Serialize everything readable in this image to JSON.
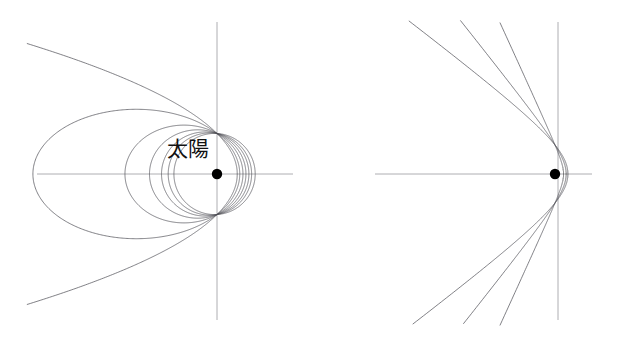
{
  "figure": {
    "title": "",
    "background_color": "#ffffff",
    "curve_color": "#4a4a52",
    "axis_color": "#9a9a9e",
    "sun_color": "#000000",
    "width": 619,
    "height": 342
  },
  "panels": [
    {
      "id": "left",
      "name": "elliptical-and-parabolic-orbits",
      "sun_label": "太陽",
      "sun_point": {
        "x": 217,
        "y": 174
      },
      "axes": {
        "horizontal": {
          "x1": 37,
          "y1": 174,
          "x2": 293,
          "y2": 174
        },
        "vertical": {
          "x1": 217,
          "y1": 22,
          "x2": 217,
          "y2": 320
        }
      },
      "orbit_count": 7
    },
    {
      "id": "right",
      "name": "hyperbolic-orbits",
      "sun_label": "太陽",
      "sun_point": {
        "x": 555,
        "y": 174
      },
      "axes": {
        "horizontal": {
          "x1": 375,
          "y1": 174,
          "x2": 592,
          "y2": 174
        },
        "vertical": {
          "x1": 558,
          "y1": 22,
          "x2": 558,
          "y2": 320
        }
      },
      "orbit_count": 3
    }
  ],
  "chart_data": {
    "type": "line",
    "title": "",
    "subtitle": "",
    "xlabel": "",
    "ylabel": "",
    "grid": false,
    "legend": "none",
    "annotations": [
      {
        "text": "太陽",
        "x": 217,
        "y": 174,
        "panel": "left"
      },
      {
        "text": "太陽",
        "x": 555,
        "y": 174,
        "panel": "right"
      }
    ],
    "series": [
      {
        "name": "ellipse-1",
        "panel": "left",
        "conic": "ellipse",
        "eccentricity": 0.78,
        "focus": [
          217,
          174
        ],
        "left_vertex_x": 37,
        "right_vertex_x": 245,
        "semi_minor": 86
      },
      {
        "name": "ellipse-2",
        "panel": "left",
        "conic": "ellipse",
        "eccentricity": 0.56,
        "focus": [
          217,
          174
        ],
        "left_vertex_x": 127,
        "right_vertex_x": 250,
        "semi_minor": 58
      },
      {
        "name": "ellipse-3",
        "panel": "left",
        "conic": "ellipse",
        "eccentricity": 0.4,
        "focus": [
          217,
          174
        ],
        "left_vertex_x": 155,
        "right_vertex_x": 253,
        "semi_minor": 48
      },
      {
        "name": "ellipse-4",
        "panel": "left",
        "conic": "ellipse",
        "eccentricity": 0.27,
        "focus": [
          217,
          174
        ],
        "left_vertex_x": 172,
        "right_vertex_x": 255,
        "semi_minor": 43
      },
      {
        "name": "ellipse-5",
        "panel": "left",
        "conic": "ellipse",
        "eccentricity": 0.17,
        "focus": [
          217,
          174
        ],
        "left_vertex_x": 180,
        "right_vertex_x": 256,
        "semi_minor": 41
      },
      {
        "name": "ellipse-6",
        "panel": "left",
        "conic": "circle",
        "eccentricity": 0.06,
        "focus": [
          217,
          174
        ],
        "left_vertex_x": 185,
        "right_vertex_x": 258,
        "semi_minor": 40
      },
      {
        "name": "parabola",
        "panel": "left",
        "conic": "parabola",
        "eccentricity": 1.0,
        "focus": [
          217,
          174
        ],
        "vertex_x": 180,
        "open_end_x": 28,
        "open_end_y_top": 44,
        "open_end_y_bottom": 304
      },
      {
        "name": "hyperbola-1",
        "panel": "right",
        "conic": "hyperbola",
        "eccentricity": 1.25,
        "focus": [
          555,
          174
        ],
        "vertex_x": 567,
        "open_end_x": 382,
        "open_end_y_top": 26,
        "open_end_y_bottom": 322
      },
      {
        "name": "hyperbola-2",
        "panel": "right",
        "conic": "hyperbola",
        "eccentricity": 1.6,
        "focus": [
          555,
          174
        ],
        "vertex_x": 570,
        "open_end_x": 382,
        "open_end_y_top": 26,
        "open_end_y_bottom": 322
      },
      {
        "name": "hyperbola-3",
        "panel": "right",
        "conic": "hyperbola",
        "eccentricity": 2.4,
        "focus": [
          555,
          174
        ],
        "vertex_x": 572,
        "open_end_x": 468,
        "open_end_y_top": 24,
        "open_end_y_bottom": 324
      }
    ]
  }
}
